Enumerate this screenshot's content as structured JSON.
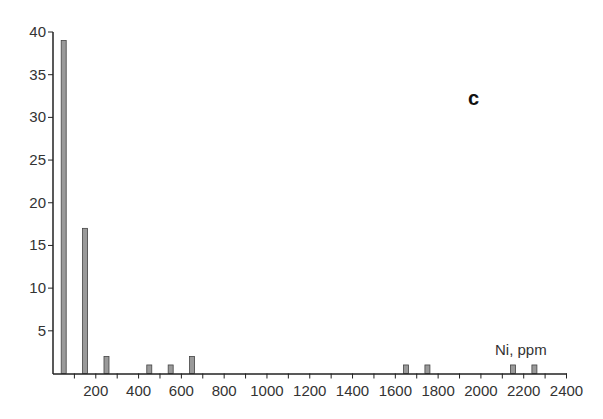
{
  "chart_data": {
    "type": "bar",
    "title": "",
    "panel_label": "c",
    "xlabel": "Ni, ppm",
    "ylabel": "",
    "x": [
      50,
      150,
      250,
      450,
      550,
      650,
      1650,
      1750,
      2150,
      2250
    ],
    "values": [
      39,
      17,
      2,
      1,
      1,
      2,
      1,
      1,
      1,
      1
    ],
    "xlim": [
      0,
      2400
    ],
    "ylim": [
      0,
      40
    ],
    "x_ticks": [
      200,
      400,
      600,
      800,
      1000,
      1200,
      1400,
      1600,
      1800,
      2000,
      2200,
      2400
    ],
    "x_minor_ticks": [
      100,
      300,
      500,
      700,
      900,
      1100,
      1300,
      1500,
      1700,
      1900,
      2100,
      2300
    ],
    "y_ticks": [
      5,
      10,
      15,
      20,
      25,
      30,
      35,
      40
    ],
    "grid": false,
    "legend": null,
    "bar_color": "#9a9a9a",
    "bar_edge": "#444444"
  }
}
